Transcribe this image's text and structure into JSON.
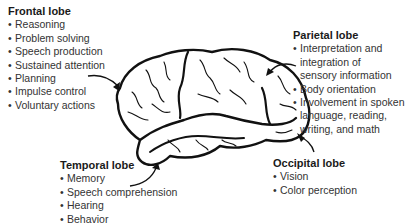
{
  "diagram": {
    "lobes": {
      "frontal": {
        "title": "Frontal lobe",
        "items": [
          "Reasoning",
          "Problem solving",
          "Speech production",
          "Sustained attention",
          "Planning",
          "Impulse control",
          "Voluntary actions"
        ]
      },
      "parietal": {
        "title": "Parietal lobe",
        "items": [
          [
            "Interpretation and",
            "integration of",
            "sensory information"
          ],
          [
            "Body orientation"
          ],
          [
            "Involvement in spoken",
            "language, reading,",
            "writing, and math"
          ]
        ]
      },
      "temporal": {
        "title": "Temporal lobe",
        "items": [
          "Memory",
          "Speech comprehension",
          "Hearing",
          "Behavior"
        ]
      },
      "occipital": {
        "title": "Occipital lobe",
        "items": [
          "Vision",
          "Color perception"
        ]
      }
    }
  }
}
